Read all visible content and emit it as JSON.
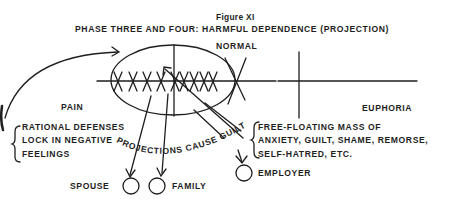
{
  "figure": {
    "label": "Figure XI",
    "title": "PHASE THREE AND FOUR: HARMFUL DEPENDENCE (PROJECTION)",
    "normal_label": "NORMAL",
    "pain_label": "PAIN",
    "euphoria_label": "EUPHORIA",
    "defenses_note": [
      "RATIONAL DEFENSES",
      "LOCK IN NEGATIVE",
      "FEELINGS"
    ],
    "anxiety_note": [
      "FREE-FLOATING MASS OF",
      "ANXIETY, GUILT, SHAME, REMORSE,",
      "SELF-HATRED, ETC."
    ],
    "curved_caption": "PROJECTIONS CAUSE GUILT",
    "targets": [
      "SPOUSE",
      "FAMILY",
      "EMPLOYER"
    ],
    "x_marks_count": 9
  }
}
